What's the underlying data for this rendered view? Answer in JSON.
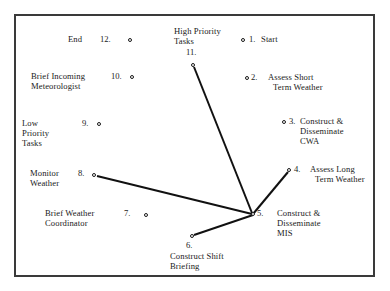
{
  "figure": {
    "type": "node-link-diagram",
    "border_color": "#3a3a3a",
    "background": "#ffffff",
    "line_color": "#111111",
    "node_marker": "open-circle"
  },
  "nodes": [
    {
      "id": "1",
      "number": "1.",
      "label": "Start",
      "label_lines": [
        "Start"
      ],
      "marker_x": 243,
      "marker_y": 40,
      "label_side": "right"
    },
    {
      "id": "2",
      "number": "2.",
      "label": "Assess Short Term Weather",
      "label_lines": [
        "Assess Short",
        "Term Weather"
      ],
      "marker_x": 247,
      "marker_y": 78,
      "label_side": "right"
    },
    {
      "id": "3",
      "number": "3.",
      "label": "Construct & Disseminate CWA",
      "label_lines": [
        "Construct &",
        "Disseminate",
        "CWA"
      ],
      "marker_x": 284,
      "marker_y": 122,
      "label_side": "right"
    },
    {
      "id": "4",
      "number": "4.",
      "label": "Assess Long Term Weather",
      "label_lines": [
        "Assess Long",
        "Term Weather"
      ],
      "marker_x": 289,
      "marker_y": 170,
      "label_side": "right"
    },
    {
      "id": "5",
      "number": "5.",
      "label": "Construct & Disseminate MIS",
      "label_lines": [
        "Construct &",
        "Disseminate",
        "MIS"
      ],
      "marker_x": 253,
      "marker_y": 214,
      "label_side": "right"
    },
    {
      "id": "6",
      "number": "6.",
      "label": "Construct Shift Briefing",
      "label_lines": [
        "Construct Shift",
        "Briefing"
      ],
      "marker_x": 192,
      "marker_y": 236,
      "label_side": "below"
    },
    {
      "id": "7",
      "number": "7.",
      "label": "Brief Weather Coordinator",
      "label_lines": [
        "Brief Weather",
        "Coordinator"
      ],
      "marker_x": 146,
      "marker_y": 215,
      "label_side": "left"
    },
    {
      "id": "8",
      "number": "8.",
      "label": "Monitor Weather",
      "label_lines": [
        "Monitor",
        "Weather"
      ],
      "marker_x": 94,
      "marker_y": 175,
      "label_side": "left"
    },
    {
      "id": "9",
      "number": "9.",
      "label": "Low Priority Tasks",
      "label_lines": [
        "Low",
        "Priority",
        "Tasks"
      ],
      "marker_x": 99,
      "marker_y": 124,
      "label_side": "left"
    },
    {
      "id": "10",
      "number": "10.",
      "label": "Brief Incoming Meteorologist",
      "label_lines": [
        "Brief Incoming",
        "Meteorologist"
      ],
      "marker_x": 132,
      "marker_y": 77,
      "label_side": "left"
    },
    {
      "id": "11",
      "number": "11.",
      "label": "High Priority Tasks",
      "label_lines": [
        "High Priority",
        "Tasks"
      ],
      "marker_x": 193,
      "marker_y": 65,
      "label_side": "above"
    },
    {
      "id": "12",
      "number": "12.",
      "label": "End",
      "label_lines": [
        "End"
      ],
      "marker_x": 130,
      "marker_y": 40,
      "label_side": "left"
    }
  ],
  "edges": [
    {
      "from": "11",
      "to": "5"
    },
    {
      "from": "8",
      "to": "5"
    },
    {
      "from": "6",
      "to": "5"
    },
    {
      "from": "4",
      "to": "5"
    }
  ]
}
